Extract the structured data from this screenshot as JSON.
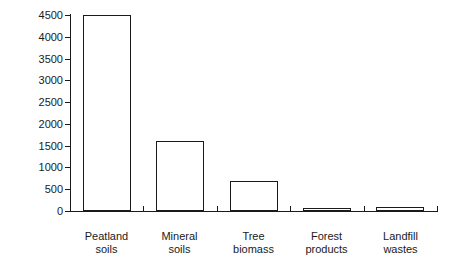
{
  "chart_data": {
    "type": "bar",
    "title": "",
    "xlabel": "",
    "ylabel": "Carbon (Mt)",
    "ylim": [
      0,
      4500
    ],
    "ytick_step": 500,
    "grid": false,
    "legend": false,
    "bar_style": "outlined-white",
    "categories": [
      "Peatland\nsoils",
      "Mineral\nsoils",
      "Tree\nbiomass",
      "Forest\nproducts",
      "Landfill\nwastes"
    ],
    "category_lines": [
      [
        "Peatland",
        "soils"
      ],
      [
        "Mineral",
        "soils"
      ],
      [
        "Tree",
        "biomass"
      ],
      [
        "Forest",
        "products"
      ],
      [
        "Landfill",
        "wastes"
      ]
    ],
    "values": [
      4500,
      1600,
      700,
      60,
      100
    ],
    "ytick_labels": [
      "0",
      "500",
      "1000",
      "1500",
      "2000",
      "2500",
      "3000",
      "3500",
      "4000",
      "4500"
    ],
    "ytick_values": [
      0,
      500,
      1000,
      1500,
      2000,
      2500,
      3000,
      3500,
      4000,
      4500
    ]
  },
  "colors": {
    "ink": "#1a1a1a",
    "background": "#ffffff",
    "bar_fill": "#ffffff",
    "bar_stroke": "#1a1a1a"
  }
}
